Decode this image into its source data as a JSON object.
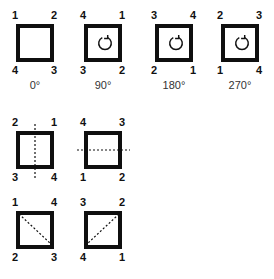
{
  "rotations": [
    {
      "corners": {
        "tl": "1",
        "tr": "2",
        "bl": "4",
        "br": "3"
      },
      "label": "0°",
      "rotation_icon": false
    },
    {
      "corners": {
        "tl": "4",
        "tr": "1",
        "bl": "3",
        "br": "2"
      },
      "label": "90°",
      "rotation_icon": true
    },
    {
      "corners": {
        "tl": "3",
        "tr": "4",
        "bl": "2",
        "br": "1"
      },
      "label": "180°",
      "rotation_icon": true
    },
    {
      "corners": {
        "tl": "2",
        "tr": "3",
        "bl": "1",
        "br": "4"
      },
      "label": "270°",
      "rotation_icon": true
    }
  ],
  "flips": [
    {
      "corners": {
        "tl": "2",
        "tr": "1",
        "bl": "3",
        "br": "4"
      },
      "axis": "vertical"
    },
    {
      "corners": {
        "tl": "4",
        "tr": "3",
        "bl": "1",
        "br": "2"
      },
      "axis": "horizontal"
    }
  ],
  "diagonals": [
    {
      "corners": {
        "tl": "1",
        "tr": "4",
        "bl": "2",
        "br": "3"
      },
      "axis": "main-diagonal"
    },
    {
      "corners": {
        "tl": "3",
        "tr": "2",
        "bl": "4",
        "br": "1"
      },
      "axis": "anti-diagonal"
    }
  ],
  "colors": {
    "stroke": "#0f0f0f",
    "background": "#ffffff"
  }
}
